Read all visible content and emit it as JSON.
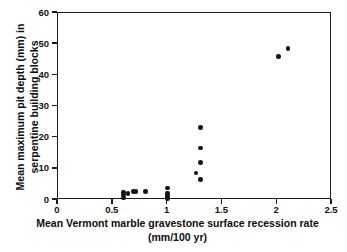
{
  "chart_data": {
    "type": "scatter",
    "title": "",
    "xlabel": "Mean Vermont marble gravestone surface recession rate (mm/100 yr)",
    "ylabel": "Mean maximum pit depth (mm) in serpentine building blocks",
    "xlim": [
      0,
      2.5
    ],
    "ylim": [
      0,
      60
    ],
    "xticks": [
      "0",
      "0.5",
      "1",
      "1.5",
      "2",
      "2.5"
    ],
    "xtick_values": [
      0,
      0.5,
      1,
      1.5,
      2,
      2.5
    ],
    "yticks": [
      "0",
      "10",
      "20",
      "30",
      "40",
      "50",
      "60"
    ],
    "ytick_values": [
      0,
      10,
      20,
      30,
      40,
      50,
      60
    ],
    "grid": false,
    "legend": null,
    "marker": {
      "shape": "circle",
      "color": "#151515",
      "size": 4.6
    },
    "series": [
      {
        "name": "serpentine building blocks",
        "points": [
          {
            "x": 0.6,
            "y": 0.6
          },
          {
            "x": 0.6,
            "y": 1.6
          },
          {
            "x": 0.6,
            "y": 2.4
          },
          {
            "x": 0.64,
            "y": 2.1
          },
          {
            "x": 0.69,
            "y": 2.8
          },
          {
            "x": 0.71,
            "y": 2.8
          },
          {
            "x": 0.8,
            "y": 2.8
          },
          {
            "x": 1.0,
            "y": 0.4
          },
          {
            "x": 1.0,
            "y": 1.0
          },
          {
            "x": 1.0,
            "y": 1.6
          },
          {
            "x": 1.0,
            "y": 2.2
          },
          {
            "x": 1.0,
            "y": 3.9
          },
          {
            "x": 1.26,
            "y": 8.6
          },
          {
            "x": 1.3,
            "y": 6.5
          },
          {
            "x": 1.3,
            "y": 12.0
          },
          {
            "x": 1.3,
            "y": 16.7
          },
          {
            "x": 1.3,
            "y": 23.3
          },
          {
            "x": 2.01,
            "y": 46.0
          },
          {
            "x": 2.1,
            "y": 48.6
          }
        ]
      }
    ]
  },
  "axis_labels": {
    "x": "Mean Vermont marble gravestone surface recession rate (mm/100 yr)",
    "y": "Mean maximum pit depth (mm) in serpentine building blocks"
  },
  "colors": {
    "marker": "#151515",
    "frame": "#1a1a1a",
    "text": "#0d0d0d",
    "background": "#ffffff"
  }
}
